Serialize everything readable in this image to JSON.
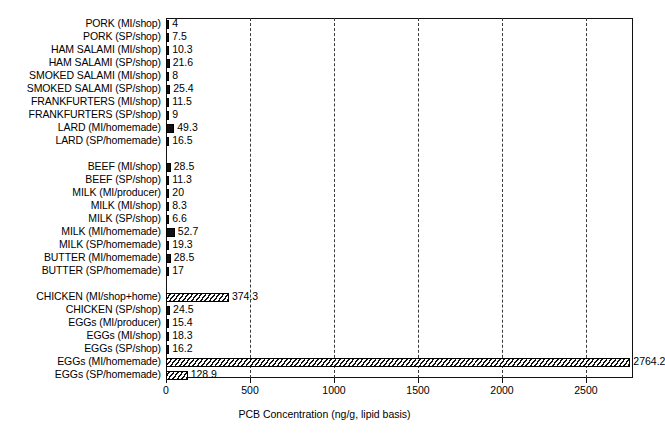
{
  "chart_data": {
    "type": "bar",
    "orientation": "horizontal",
    "title": "",
    "xlabel": "PCB Concentration (ng/g, lipid basis)",
    "ylabel": "",
    "xlim": [
      0,
      2800
    ],
    "xticks": [
      0,
      500,
      1000,
      1500,
      2000,
      2500
    ],
    "xtick_labels": [
      "0",
      "500",
      "1000",
      "1500",
      "2000",
      "2500"
    ],
    "grid": "vertical-dashed",
    "legend": "none",
    "value_labels": true,
    "groups": [
      {
        "categories": [
          "PORK (MI/shop)",
          "PORK (SP/shop)",
          "HAM SALAMI (MI/shop)",
          "HAM SALAMI (SP/shop)",
          "SMOKED SALAMI (MI/shop)",
          "SMOKED SALAMI (SP/shop)",
          "FRANKFURTERS (MI/shop)",
          "FRANKFURTERS (SP/shop)",
          "LARD (MI/homemade)",
          "LARD (SP/homemade)"
        ],
        "values": [
          4,
          7.5,
          10.3,
          21.6,
          8,
          25.4,
          11.5,
          9,
          49.3,
          16.5
        ],
        "value_text": [
          "4",
          "7.5",
          "10.3",
          "21.6",
          "8",
          "25.4",
          "11.5",
          "9",
          "49.3",
          "16.5"
        ]
      },
      {
        "categories": [
          "BEEF (MI/shop)",
          "BEEF (SP/shop)",
          "MILK (MI/producer)",
          "MILK (MI/shop)",
          "MILK (SP/shop)",
          "MILK (MI/homemade)",
          "MILK (SP/homemade)",
          "BUTTER (MI/homemade)",
          "BUTTER (SP/homemade)"
        ],
        "values": [
          28.5,
          11.3,
          20,
          8.3,
          6.6,
          52.7,
          19.3,
          28.5,
          17
        ],
        "value_text": [
          "28.5",
          "11.3",
          "20",
          "8.3",
          "6.6",
          "52.7",
          "19.3",
          "28.5",
          "17"
        ]
      },
      {
        "categories": [
          "CHICKEN (MI/shop+home)",
          "CHICKEN (SP/shop)",
          "EGGs (MI/producer)",
          "EGGs (MI/shop)",
          "EGGs (SP/shop)",
          "EGGs (MI/homemade)",
          "EGGs (SP/homemade)"
        ],
        "values": [
          374.3,
          24.5,
          15.4,
          18.3,
          16.2,
          2764.2,
          128.9
        ],
        "value_text": [
          "374.3",
          "24.5",
          "15.4",
          "18.3",
          "16.2",
          "2764.2",
          "128.9"
        ]
      }
    ]
  }
}
